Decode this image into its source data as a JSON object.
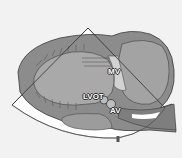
{
  "figure": {
    "type": "anatomical-diagram",
    "colors": {
      "background": "#f2f2f2",
      "myocardium": "#8a8a8a",
      "myocardium_dark": "#5e5e5e",
      "chamber": "#a8a8a8",
      "sector_fill": "#ffffff",
      "outline": "#3a3a3a",
      "label_text": "#ffffff"
    },
    "labels": {
      "mv": "MV",
      "lvot": "LVOT",
      "av": "AV"
    },
    "bottom_marker": "I"
  }
}
